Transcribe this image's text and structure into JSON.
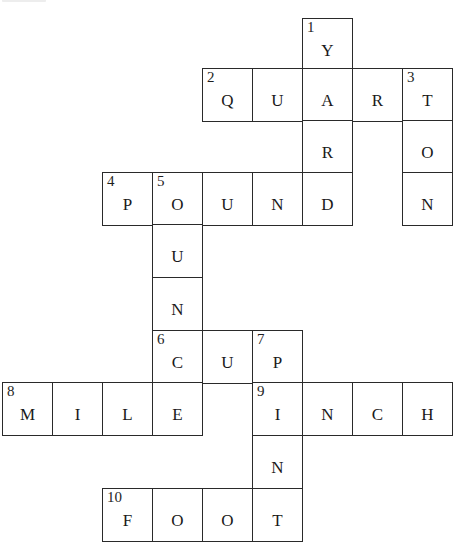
{
  "puzzle": {
    "type": "crossword",
    "title_visible": false,
    "cells": [
      {
        "row": 0,
        "col": 6,
        "letter": "Y",
        "number": "1"
      },
      {
        "row": 1,
        "col": 4,
        "letter": "Q",
        "number": "2"
      },
      {
        "row": 1,
        "col": 5,
        "letter": "U",
        "number": ""
      },
      {
        "row": 1,
        "col": 6,
        "letter": "A",
        "number": ""
      },
      {
        "row": 1,
        "col": 7,
        "letter": "R",
        "number": ""
      },
      {
        "row": 1,
        "col": 8,
        "letter": "T",
        "number": "3"
      },
      {
        "row": 2,
        "col": 6,
        "letter": "R",
        "number": ""
      },
      {
        "row": 2,
        "col": 8,
        "letter": "O",
        "number": ""
      },
      {
        "row": 3,
        "col": 2,
        "letter": "P",
        "number": "4"
      },
      {
        "row": 3,
        "col": 3,
        "letter": "O",
        "number": "5"
      },
      {
        "row": 3,
        "col": 4,
        "letter": "U",
        "number": ""
      },
      {
        "row": 3,
        "col": 5,
        "letter": "N",
        "number": ""
      },
      {
        "row": 3,
        "col": 6,
        "letter": "D",
        "number": ""
      },
      {
        "row": 3,
        "col": 8,
        "letter": "N",
        "number": ""
      },
      {
        "row": 4,
        "col": 3,
        "letter": "U",
        "number": ""
      },
      {
        "row": 5,
        "col": 3,
        "letter": "N",
        "number": ""
      },
      {
        "row": 6,
        "col": 3,
        "letter": "C",
        "number": "6"
      },
      {
        "row": 6,
        "col": 4,
        "letter": "U",
        "number": ""
      },
      {
        "row": 6,
        "col": 5,
        "letter": "P",
        "number": "7"
      },
      {
        "row": 7,
        "col": 0,
        "letter": "M",
        "number": "8"
      },
      {
        "row": 7,
        "col": 1,
        "letter": "I",
        "number": ""
      },
      {
        "row": 7,
        "col": 2,
        "letter": "L",
        "number": ""
      },
      {
        "row": 7,
        "col": 3,
        "letter": "E",
        "number": ""
      },
      {
        "row": 7,
        "col": 5,
        "letter": "I",
        "number": "9"
      },
      {
        "row": 7,
        "col": 6,
        "letter": "N",
        "number": ""
      },
      {
        "row": 7,
        "col": 7,
        "letter": "C",
        "number": ""
      },
      {
        "row": 7,
        "col": 8,
        "letter": "H",
        "number": ""
      },
      {
        "row": 8,
        "col": 5,
        "letter": "N",
        "number": ""
      },
      {
        "row": 9,
        "col": 2,
        "letter": "F",
        "number": "10"
      },
      {
        "row": 9,
        "col": 3,
        "letter": "O",
        "number": ""
      },
      {
        "row": 9,
        "col": 4,
        "letter": "O",
        "number": ""
      },
      {
        "row": 9,
        "col": 5,
        "letter": "T",
        "number": ""
      }
    ],
    "words": {
      "across": [
        {
          "number": "2",
          "answer": "QUART"
        },
        {
          "number": "4",
          "answer": "POUND"
        },
        {
          "number": "6",
          "answer": "CUP"
        },
        {
          "number": "8",
          "answer": "MILE"
        },
        {
          "number": "9",
          "answer": "INCH"
        },
        {
          "number": "10",
          "answer": "FOOT"
        }
      ],
      "down": [
        {
          "number": "1",
          "answer": "YARD"
        },
        {
          "number": "3",
          "answer": "TON"
        },
        {
          "number": "5",
          "answer": "OUNCE"
        },
        {
          "number": "7",
          "answer": "PINT"
        }
      ]
    }
  }
}
